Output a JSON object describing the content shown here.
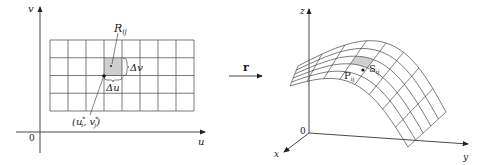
{
  "left_panel": {
    "v_axis_label": "v",
    "u_axis_label": "u",
    "origin_label": "0",
    "region_label_main": "R",
    "region_label_sub": "ij",
    "delta_v_label": "Δv",
    "delta_u_label": "Δu",
    "sample_point_label": "(u",
    "sample_point_sub_i": "i",
    "sample_point_mid": ", v",
    "sample_point_sub_j": "j",
    "sample_point_close": ")",
    "star": "*",
    "grid_columns": 8,
    "grid_rows": 4
  },
  "mapping": {
    "arrow_label": "r"
  },
  "right_panel": {
    "z_axis_label": "z",
    "x_axis_label": "x",
    "y_axis_label": "y",
    "origin_label": "0",
    "point_label_main": "P",
    "point_label_sub": "ij",
    "patch_label_main": "S",
    "patch_label_sub": "ij",
    "grid_columns": 8,
    "grid_rows": 5
  },
  "colors": {
    "line": "#333333",
    "shade": "#cfcfcf"
  }
}
